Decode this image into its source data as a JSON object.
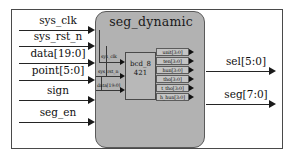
{
  "diagram": {
    "title": "seg_dynamic",
    "inner_block": {
      "line1": "bcd_8",
      "line2": "421"
    },
    "external_inputs": [
      {
        "label": "sys_clk"
      },
      {
        "label": "sys_rst_n"
      },
      {
        "label": "data[19:0]"
      },
      {
        "label": "point[5:0]"
      },
      {
        "label": "sign"
      },
      {
        "label": "seg_en"
      }
    ],
    "external_outputs": [
      {
        "label": "sel[5:0]"
      },
      {
        "label": "seg[7:0]"
      }
    ],
    "inner_input_ports": [
      {
        "label": "sys_clk"
      },
      {
        "label": "sys_rst_n"
      },
      {
        "label": "data[19:0]"
      }
    ],
    "inner_output_ports": [
      {
        "label": "unit[3:0]"
      },
      {
        "label": "ten[3:0]"
      },
      {
        "label": "hun[3:0]"
      },
      {
        "label": "tho[3:0]"
      },
      {
        "label": "t_tho[3:0]"
      },
      {
        "label": "h_hun[3:0]"
      }
    ],
    "colors": {
      "module_fill": "#b2b2b2",
      "inner_fill": "#b8b8b8",
      "port_fill": "#c4c4c4",
      "wire": "#242424",
      "frame": "#4a4a4a",
      "page_background": "#ffffff"
    }
  }
}
